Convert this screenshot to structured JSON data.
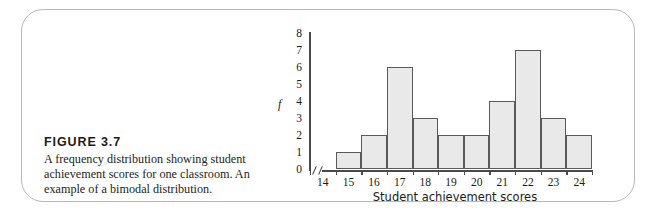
{
  "figure": {
    "number_label": "FIGURE 3.7",
    "caption": "A frequency distribution showing student achievement scores for one classroom. An example of a bimodal distribution."
  },
  "chart_data": {
    "type": "bar",
    "title": "",
    "xlabel": "Student achievement scores",
    "ylabel": "f",
    "categories": [
      "14",
      "15",
      "16",
      "17",
      "18",
      "19",
      "20",
      "21",
      "22",
      "23",
      "24"
    ],
    "values": [
      0,
      1,
      2,
      6,
      3,
      2,
      2,
      4,
      7,
      3,
      2
    ],
    "ylim": [
      0,
      8
    ],
    "ytick_labels": [
      "8",
      "7",
      "6",
      "5",
      "4",
      "3",
      "2",
      "1",
      "0"
    ],
    "grid": false,
    "legend": null,
    "axis_break": true,
    "bar_fill": "#e9e9e9",
    "bar_stroke": "#5a5a5a",
    "axis_color": "#4a4a4a"
  },
  "card": {
    "border_color": "#b9b9b9"
  }
}
